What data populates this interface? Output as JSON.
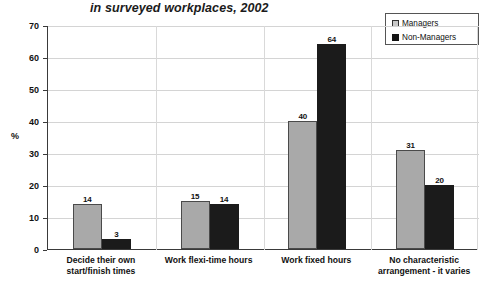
{
  "chart_data": {
    "type": "bar",
    "title": "in surveyed workplaces, 2002",
    "xlabel": "",
    "ylabel": "%",
    "ylim": [
      0,
      70
    ],
    "ystep": 10,
    "grid": true,
    "legend_position": "top-right",
    "categories": [
      "Decide their own start/finish times",
      "Work flexi-time hours",
      "Work fixed hours",
      "No characteristic arrangement - it varies"
    ],
    "category_lines": [
      [
        "Decide their own",
        "start/finish times"
      ],
      [
        "Work flexi-time hours",
        ""
      ],
      [
        "Work fixed hours",
        ""
      ],
      [
        "No characteristic",
        "arrangement - it varies"
      ]
    ],
    "series": [
      {
        "name": "Managers",
        "values": [
          14,
          15,
          40,
          31
        ],
        "color": "#a9a9a9"
      },
      {
        "name": "Non-Managers",
        "values": [
          3,
          14,
          64,
          20
        ],
        "color": "#1b1b1b"
      }
    ],
    "ytick_labels": [
      "70",
      "60",
      "50",
      "40",
      "30",
      "20",
      "10",
      "0"
    ],
    "ytick_values": [
      70,
      60,
      50,
      40,
      30,
      20,
      10,
      0
    ]
  },
  "legend": {
    "items": [
      {
        "label": "Managers",
        "swatch": "managers"
      },
      {
        "label": "Non-Managers",
        "swatch": "nonmanagers"
      }
    ]
  }
}
